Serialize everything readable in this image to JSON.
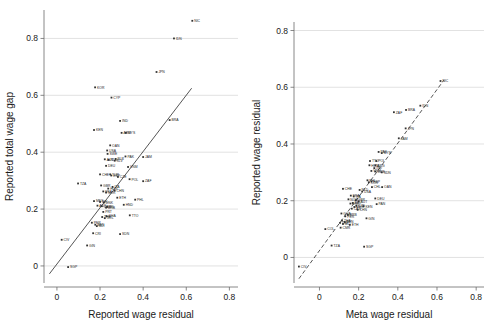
{
  "figure": {
    "background": "#ffffff",
    "gridline_color": "#d5d5d5",
    "marker_color": "#333333",
    "fitline_color": "#2a2a2a"
  },
  "chart_data": [
    {
      "type": "scatter",
      "panel": "left",
      "title": "",
      "xlabel": "Reported wage residual",
      "ylabel": "Reported total wage gap",
      "xlim": [
        -0.06,
        0.84
      ],
      "ylim": [
        -0.06,
        0.9
      ],
      "xticks": [
        "0",
        "0.2",
        "0.4",
        "0.6",
        "0.8"
      ],
      "xtick_values": [
        0,
        0.2,
        0.4,
        0.6,
        0.8
      ],
      "yticks": [
        "0",
        "0.2",
        "0.4",
        "0.6",
        "0.8"
      ],
      "ytick_values": [
        0,
        0.2,
        0.4,
        0.6,
        0.8
      ],
      "grid": "horizontal",
      "legend": "none",
      "fit_line": {
        "style": "solid",
        "x": [
          -0.035,
          0.625
        ],
        "y": [
          -0.028,
          0.625
        ]
      },
      "points": [
        {
          "label": "NIC",
          "x": 0.628,
          "y": 0.862
        },
        {
          "label": "IDN",
          "x": 0.543,
          "y": 0.8
        },
        {
          "label": "JPN",
          "x": 0.462,
          "y": 0.682
        },
        {
          "label": "KOR",
          "x": 0.177,
          "y": 0.628
        },
        {
          "label": "CYP",
          "x": 0.253,
          "y": 0.592
        },
        {
          "label": "BRA",
          "x": 0.523,
          "y": 0.513
        },
        {
          "label": "IND",
          "x": 0.293,
          "y": 0.51
        },
        {
          "label": "KEN",
          "x": 0.172,
          "y": 0.478
        },
        {
          "label": "ARG",
          "x": 0.3,
          "y": 0.468
        },
        {
          "label": "MYS",
          "x": 0.32,
          "y": 0.468
        },
        {
          "label": "OAN",
          "x": 0.247,
          "y": 0.424
        },
        {
          "label": "USA",
          "x": 0.233,
          "y": 0.406
        },
        {
          "label": "SWE",
          "x": 0.235,
          "y": 0.394
        },
        {
          "label": "PAK",
          "x": 0.318,
          "y": 0.385
        },
        {
          "label": "JAM",
          "x": 0.4,
          "y": 0.383
        },
        {
          "label": "BLR",
          "x": 0.272,
          "y": 0.376
        },
        {
          "label": "AUT",
          "x": 0.222,
          "y": 0.375
        },
        {
          "label": "NLD",
          "x": 0.24,
          "y": 0.373
        },
        {
          "label": "SLV",
          "x": 0.268,
          "y": 0.37
        },
        {
          "label": "DEU",
          "x": 0.228,
          "y": 0.352
        },
        {
          "label": "VNM",
          "x": 0.33,
          "y": 0.348
        },
        {
          "label": "CHE",
          "x": 0.2,
          "y": 0.322
        },
        {
          "label": "TUR",
          "x": 0.247,
          "y": 0.322
        },
        {
          "label": "ESP",
          "x": 0.252,
          "y": 0.318
        },
        {
          "label": "CZE",
          "x": 0.283,
          "y": 0.313
        },
        {
          "label": "POL",
          "x": 0.337,
          "y": 0.305
        },
        {
          "label": "ZAF",
          "x": 0.4,
          "y": 0.298
        },
        {
          "label": "TZA",
          "x": 0.098,
          "y": 0.29
        },
        {
          "label": "GBR",
          "x": 0.205,
          "y": 0.283
        },
        {
          "label": "ITA",
          "x": 0.258,
          "y": 0.278
        },
        {
          "label": "HUN",
          "x": 0.238,
          "y": 0.272
        },
        {
          "label": "CHN",
          "x": 0.268,
          "y": 0.265
        },
        {
          "label": "FRA",
          "x": 0.215,
          "y": 0.262
        },
        {
          "label": "NOR",
          "x": 0.228,
          "y": 0.258
        },
        {
          "label": "ETH",
          "x": 0.28,
          "y": 0.24
        },
        {
          "label": "PHL",
          "x": 0.363,
          "y": 0.233
        },
        {
          "label": "MEX",
          "x": 0.172,
          "y": 0.228
        },
        {
          "label": "BEL",
          "x": 0.2,
          "y": 0.225
        },
        {
          "label": "DNK",
          "x": 0.218,
          "y": 0.223
        },
        {
          "label": "HND",
          "x": 0.31,
          "y": 0.215
        },
        {
          "label": "AUS",
          "x": 0.188,
          "y": 0.212
        },
        {
          "label": "CAN",
          "x": 0.208,
          "y": 0.21
        },
        {
          "label": "IRL",
          "x": 0.233,
          "y": 0.208
        },
        {
          "label": "BRB",
          "x": 0.228,
          "y": 0.205
        },
        {
          "label": "PRT",
          "x": 0.215,
          "y": 0.19
        },
        {
          "label": "TTO",
          "x": 0.338,
          "y": 0.178
        },
        {
          "label": "GHA",
          "x": 0.23,
          "y": 0.175
        },
        {
          "label": "THA",
          "x": 0.21,
          "y": 0.172
        },
        {
          "label": "COL",
          "x": 0.222,
          "y": 0.168
        },
        {
          "label": "PER",
          "x": 0.162,
          "y": 0.152
        },
        {
          "label": "BEN",
          "x": 0.178,
          "y": 0.145
        },
        {
          "label": "MLI",
          "x": 0.185,
          "y": 0.14
        },
        {
          "label": "CRI",
          "x": 0.168,
          "y": 0.115
        },
        {
          "label": "SDN",
          "x": 0.293,
          "y": 0.112
        },
        {
          "label": "CIV",
          "x": 0.022,
          "y": 0.092
        },
        {
          "label": "GIN",
          "x": 0.14,
          "y": 0.072
        },
        {
          "label": "SGP",
          "x": 0.052,
          "y": -0.004
        }
      ]
    },
    {
      "type": "scatter",
      "panel": "right",
      "title": "",
      "xlabel": "Meta wage residual",
      "ylabel": "Reported wage residual",
      "xlim": [
        -0.13,
        0.84
      ],
      "ylim": [
        -0.09,
        0.83
      ],
      "xticks": [
        "0",
        "0.2",
        "0.4",
        "0.6",
        "0.8"
      ],
      "xtick_values": [
        0,
        0.2,
        0.4,
        0.6,
        0.8
      ],
      "yticks": [
        "0",
        "0.2",
        "0.4",
        "0.6",
        "0.8"
      ],
      "ytick_values": [
        0,
        0.2,
        0.4,
        0.6,
        0.8
      ],
      "grid": "horizontal",
      "legend": "none",
      "fit_line": {
        "style": "dashed",
        "x": [
          -0.105,
          0.635
        ],
        "y": [
          -0.075,
          0.625
        ]
      },
      "points": [
        {
          "label": "NIC",
          "x": 0.618,
          "y": 0.622
        },
        {
          "label": "IDN",
          "x": 0.515,
          "y": 0.535
        },
        {
          "label": "BRA",
          "x": 0.442,
          "y": 0.52
        },
        {
          "label": "ZAF",
          "x": 0.38,
          "y": 0.512
        },
        {
          "label": "JPN",
          "x": 0.44,
          "y": 0.455
        },
        {
          "label": "JAM",
          "x": 0.405,
          "y": 0.42
        },
        {
          "label": "PAK",
          "x": 0.302,
          "y": 0.372
        },
        {
          "label": "MYS",
          "x": 0.318,
          "y": 0.368
        },
        {
          "label": "TTO",
          "x": 0.258,
          "y": 0.34
        },
        {
          "label": "POL",
          "x": 0.29,
          "y": 0.34
        },
        {
          "label": "HUN",
          "x": 0.255,
          "y": 0.325
        },
        {
          "label": "ARG",
          "x": 0.285,
          "y": 0.325
        },
        {
          "label": "IND",
          "x": 0.28,
          "y": 0.315
        },
        {
          "label": "VNM",
          "x": 0.265,
          "y": 0.305
        },
        {
          "label": "SWE",
          "x": 0.285,
          "y": 0.303
        },
        {
          "label": "SDN",
          "x": 0.318,
          "y": 0.3
        },
        {
          "label": "PHL",
          "x": 0.245,
          "y": 0.272
        },
        {
          "label": "ESP",
          "x": 0.265,
          "y": 0.268
        },
        {
          "label": "KOR",
          "x": 0.252,
          "y": 0.265
        },
        {
          "label": "CHL",
          "x": 0.268,
          "y": 0.248
        },
        {
          "label": "OAN",
          "x": 0.32,
          "y": 0.248
        },
        {
          "label": "CHE",
          "x": 0.12,
          "y": 0.242
        },
        {
          "label": "NLD",
          "x": 0.205,
          "y": 0.238
        },
        {
          "label": "USA",
          "x": 0.218,
          "y": 0.232
        },
        {
          "label": "FRA",
          "x": 0.16,
          "y": 0.218
        },
        {
          "label": "ITA",
          "x": 0.175,
          "y": 0.215
        },
        {
          "label": "DEU",
          "x": 0.285,
          "y": 0.208
        },
        {
          "label": "NOR",
          "x": 0.148,
          "y": 0.205
        },
        {
          "label": "GBR",
          "x": 0.185,
          "y": 0.202
        },
        {
          "label": "AUT",
          "x": 0.2,
          "y": 0.198
        },
        {
          "label": "BEL",
          "x": 0.17,
          "y": 0.192
        },
        {
          "label": "DNK",
          "x": 0.158,
          "y": 0.19
        },
        {
          "label": "PAN",
          "x": 0.292,
          "y": 0.188
        },
        {
          "label": "CZE",
          "x": 0.188,
          "y": 0.182
        },
        {
          "label": "KEN",
          "x": 0.225,
          "y": 0.18
        },
        {
          "label": "MEX",
          "x": 0.178,
          "y": 0.178
        },
        {
          "label": "CAN",
          "x": 0.165,
          "y": 0.172
        },
        {
          "label": "CHN",
          "x": 0.195,
          "y": 0.168
        },
        {
          "label": "GHA",
          "x": 0.112,
          "y": 0.155
        },
        {
          "label": "BRB",
          "x": 0.145,
          "y": 0.15
        },
        {
          "label": "PER",
          "x": 0.132,
          "y": 0.145
        },
        {
          "label": "GIN",
          "x": 0.24,
          "y": 0.138
        },
        {
          "label": "THA",
          "x": 0.115,
          "y": 0.13
        },
        {
          "label": "BEN",
          "x": 0.128,
          "y": 0.125
        },
        {
          "label": "CRI",
          "x": 0.105,
          "y": 0.122
        },
        {
          "label": "MLI",
          "x": 0.12,
          "y": 0.118
        },
        {
          "label": "ETH",
          "x": 0.155,
          "y": 0.115
        },
        {
          "label": "CMR",
          "x": 0.108,
          "y": 0.105
        },
        {
          "label": "COL",
          "x": 0.03,
          "y": 0.1
        },
        {
          "label": "TZA",
          "x": 0.062,
          "y": 0.042
        },
        {
          "label": "SGP",
          "x": 0.228,
          "y": 0.038
        },
        {
          "label": "CIV",
          "x": -0.105,
          "y": -0.032
        }
      ]
    }
  ]
}
